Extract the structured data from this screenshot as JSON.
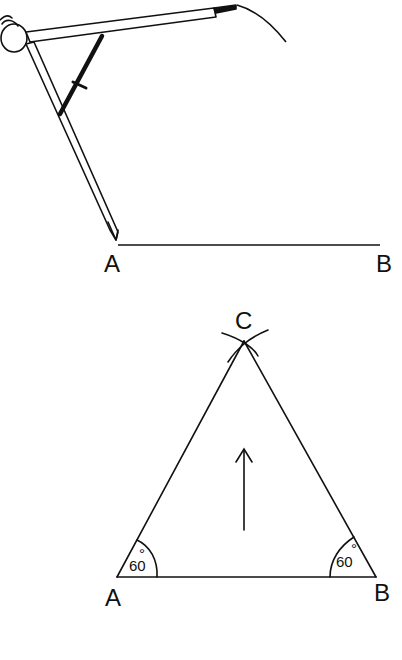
{
  "panel_top": {
    "title": "compass measuring segment AB",
    "labels": {
      "A": "A",
      "B": "B"
    },
    "tool": "compass"
  },
  "panel_bottom": {
    "title": "equilateral triangle ABC",
    "labels": {
      "A": "A",
      "B": "B",
      "C": "C"
    },
    "angle_A": "60",
    "angle_B": "60",
    "degree_mark": "°",
    "arrow": "up-arrow"
  },
  "colors": {
    "ink": "#111111",
    "background": "#ffffff"
  }
}
